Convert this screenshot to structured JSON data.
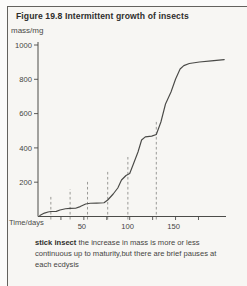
{
  "figure": {
    "title": "Figure 19.8  Intermittent growth of insects",
    "y_axis_label": "mass/mg",
    "x_axis_label": "Time/days",
    "caption_bold": "stick insect",
    "caption_text": " the increase in mass is more or less continuous up to maturity,but there are brief pauses at each ecdysis"
  },
  "colors": {
    "paper": "#f7f6f3",
    "border": "#63625e",
    "axis": "#4c4c49",
    "curve": "#4a4a47",
    "dashed_marker": "#8f8f8b",
    "tick_text": "#45443f"
  },
  "chart_data": {
    "type": "line",
    "title": "Intermittent growth of insects",
    "subtitle": "stick insect",
    "xlabel": "Time/days",
    "ylabel": "mass/mg",
    "xlim": [
      0,
      205
    ],
    "ylim": [
      0,
      1000
    ],
    "grid": false,
    "legend": "none",
    "y_ticks": [
      200,
      400,
      600,
      800,
      1000
    ],
    "x_ticks_labeled": [
      50,
      100,
      150
    ],
    "x_ticks_minor": [
      25,
      50,
      75,
      100,
      125,
      150,
      175
    ],
    "series": [
      {
        "name": "stick insect mass",
        "points": [
          [
            2,
            6
          ],
          [
            7,
            20
          ],
          [
            11,
            26
          ],
          [
            14,
            29
          ],
          [
            20,
            30
          ],
          [
            24,
            38
          ],
          [
            30,
            45
          ],
          [
            35,
            47
          ],
          [
            41,
            48
          ],
          [
            46,
            58
          ],
          [
            52,
            73
          ],
          [
            57,
            77
          ],
          [
            64,
            78
          ],
          [
            72,
            80
          ],
          [
            76,
            96
          ],
          [
            82,
            131
          ],
          [
            87,
            166
          ],
          [
            91,
            213
          ],
          [
            96,
            239
          ],
          [
            100,
            251
          ],
          [
            104,
            306
          ],
          [
            109,
            376
          ],
          [
            113,
            446
          ],
          [
            117,
            464
          ],
          [
            124,
            469
          ],
          [
            129,
            478
          ],
          [
            134,
            551
          ],
          [
            139,
            656
          ],
          [
            145,
            726
          ],
          [
            150,
            802
          ],
          [
            155,
            860
          ],
          [
            159,
            880
          ],
          [
            165,
            892
          ],
          [
            176,
            901
          ],
          [
            189,
            907
          ],
          [
            203,
            915
          ]
        ]
      }
    ],
    "annotations": {
      "ecdysis_markers": {
        "style": "dashed-vertical-line",
        "days": [
          14,
          35,
          54,
          76,
          98,
          129
        ],
        "top_mass": [
          120,
          160,
          207,
          271,
          347,
          563
        ]
      }
    }
  }
}
